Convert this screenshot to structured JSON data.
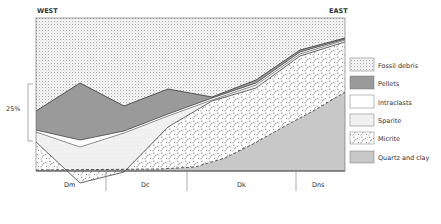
{
  "figure": {
    "west_label": "WEST",
    "east_label": "EAST",
    "scale_label": "25%",
    "zones": [
      {
        "label": "Dm",
        "x": 70
      },
      {
        "label": "Dc",
        "x": 147
      },
      {
        "label": "Dk",
        "x": 242
      },
      {
        "label": "Dns",
        "x": 320
      }
    ]
  },
  "legend": {
    "items": [
      {
        "label": "Fossil debris",
        "pattern": "fossil"
      },
      {
        "label": "Pellets",
        "pattern": "pellets"
      },
      {
        "label": "Intraclasts",
        "pattern": "intraclasts"
      },
      {
        "label": "Sparite",
        "pattern": "sparite"
      },
      {
        "label": "Micrite",
        "pattern": "micrite"
      },
      {
        "label": "Quartz and clay",
        "pattern": "quartz"
      }
    ]
  },
  "colors": {
    "fossil_bg": "#f4f4f4",
    "pellets": "#9a9a9a",
    "intraclasts": "#ffffff",
    "sparite": "#f0f0f0",
    "micrite_bg": "#ffffff",
    "quartz": "#c8c8c8",
    "line": "#444444"
  }
}
